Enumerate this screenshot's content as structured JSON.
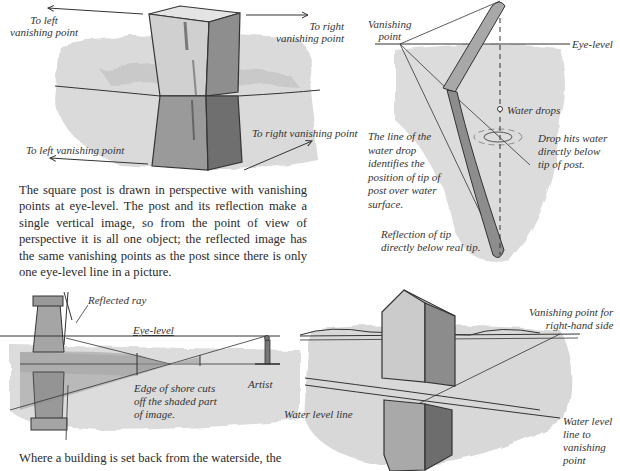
{
  "panel_post": {
    "label_top_left": [
      "To left",
      "vanishing point"
    ],
    "label_top_right": [
      "To right",
      "vanishing point"
    ],
    "label_bottom_left": "To left vanishing point",
    "label_bottom_right": "To right vanishing point",
    "caption": "The square post is drawn in perspective with vanishing points at eye-level. The post and its reflection make a single vertical image, so from the point of view of perspective it is all one object;  the reflected image has the same vanishing points as the post since there is only one eye-level line in a picture."
  },
  "panel_pole": {
    "label_vanishing_point": [
      "Vanishing",
      "point"
    ],
    "label_eye_level": "Eye-level",
    "label_water_drops": "Water drops",
    "label_drop_hits": [
      "Drop hits water",
      "directly below",
      "tip of post."
    ],
    "label_line_of_drop": [
      "The line of the",
      "water drop",
      "identifies the",
      "position of tip of",
      "post over water",
      "surface."
    ],
    "label_reflection_tip": [
      "Reflection of tip",
      "directly below real tip."
    ]
  },
  "panel_windmill": {
    "label_reflected_ray": "Reflected ray",
    "label_eye_level": "Eye-level",
    "label_artist": "Artist",
    "label_shore": [
      "Edge of shore cuts",
      "off the shaded part",
      "of image."
    ],
    "caption": "Where a building is set back from the waterside, the"
  },
  "panel_house": {
    "label_vp_right": [
      "Vanishing point for",
      "right-hand side"
    ],
    "label_water_level": "Water level line",
    "label_water_level_vp": [
      "Water level",
      "line to",
      "vanishing",
      "point"
    ]
  },
  "colors": {
    "ink": "#2a2a2a",
    "wash_light": "#d8d8d8",
    "wash_mid": "#b5b5b5",
    "wash_dark": "#7d7d7d"
  }
}
